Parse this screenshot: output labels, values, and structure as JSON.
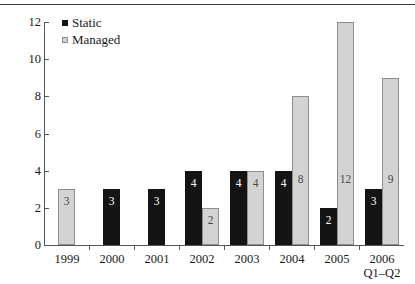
{
  "chart_data": {
    "type": "bar",
    "title": "",
    "subtitle": "",
    "xlabel": "",
    "ylabel": "",
    "ylim": [
      0,
      12
    ],
    "yticks": [
      0,
      2,
      4,
      6,
      8,
      10,
      12
    ],
    "grid": false,
    "legend_position": "top-left-inside",
    "categories": [
      "1999",
      "2000",
      "2001",
      "2002",
      "2003",
      "2004",
      "2005",
      "2006"
    ],
    "category_sublabels": [
      "",
      "",
      "",
      "",
      "",
      "",
      "",
      "Q1–Q2"
    ],
    "series": [
      {
        "name": "Static",
        "color": "#141414",
        "values": [
          null,
          3,
          3,
          4,
          4,
          4,
          2,
          3
        ],
        "labels": [
          "",
          "3",
          "3",
          "4",
          "4",
          "4",
          "2",
          "3"
        ]
      },
      {
        "name": "Managed",
        "color": "#d3d3d3",
        "values": [
          3,
          null,
          null,
          2,
          4,
          8,
          12,
          9
        ],
        "labels": [
          "3",
          "",
          "",
          "2",
          "4",
          "8",
          "12",
          "9"
        ]
      }
    ]
  },
  "legend": {
    "items": [
      {
        "label": "Static",
        "swatch": "static-swatch"
      },
      {
        "label": "Managed",
        "swatch": "managed-swatch"
      }
    ]
  },
  "axis": {
    "y_tick_labels": [
      "12",
      "10",
      "8",
      "6",
      "4",
      "2",
      "0"
    ]
  }
}
